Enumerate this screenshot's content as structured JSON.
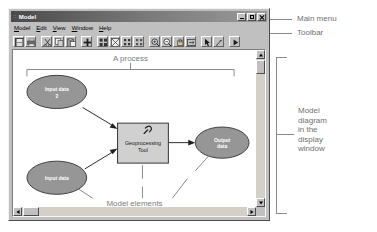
{
  "window": {
    "title": "Model",
    "title_prefix_dots": "::",
    "controls": [
      {
        "name": "minimize",
        "label": "Minimize"
      },
      {
        "name": "maximize",
        "label": "Maximize"
      },
      {
        "name": "close",
        "label": "Close"
      }
    ]
  },
  "menu": {
    "items": [
      {
        "label": "Model",
        "mnemonic": "M"
      },
      {
        "label": "Edit",
        "mnemonic": "E"
      },
      {
        "label": "View",
        "mnemonic": "V"
      },
      {
        "label": "Window",
        "mnemonic": "W"
      },
      {
        "label": "Help",
        "mnemonic": "H"
      }
    ]
  },
  "toolbar": {
    "buttons": [
      {
        "icon": "save-icon",
        "label": "Save"
      },
      {
        "icon": "print-icon",
        "label": "Print"
      },
      {
        "icon": "cut-icon",
        "label": "Cut"
      },
      {
        "icon": "copy-icon",
        "label": "Copy"
      },
      {
        "icon": "paste-icon",
        "label": "Paste"
      },
      {
        "icon": "add-data-icon",
        "label": "Add Data"
      },
      {
        "icon": "auto-layout-icon",
        "label": "Auto Layout"
      },
      {
        "icon": "diagram-properties-icon",
        "label": "Diagram Properties"
      },
      {
        "icon": "select-all-icon",
        "label": "Select All"
      },
      {
        "icon": "full-extent-icon",
        "label": "Full Extent"
      },
      {
        "icon": "zoom-in-icon",
        "label": "Zoom In"
      },
      {
        "icon": "zoom-out-icon",
        "label": "Zoom Out"
      },
      {
        "icon": "pan-icon",
        "label": "Pan"
      },
      {
        "icon": "fit-window-icon",
        "label": "Fit To Window"
      },
      {
        "icon": "select-pointer-icon",
        "label": "Select Elements"
      },
      {
        "icon": "connect-icon",
        "label": "Connect"
      },
      {
        "icon": "run-icon",
        "label": "Run"
      }
    ]
  },
  "diagram": {
    "process_label": "A process",
    "elements_label": "Model elements",
    "nodes": [
      {
        "name": "input-data-2",
        "type": "ellipse",
        "label_lines": [
          "Input data",
          "2"
        ]
      },
      {
        "name": "input-data",
        "type": "ellipse",
        "label_lines": [
          "Input data"
        ]
      },
      {
        "name": "geoprocessing-tool",
        "type": "rectangle",
        "label_lines": [
          "Geoprocessing",
          "Tool"
        ]
      },
      {
        "name": "output-data",
        "type": "ellipse",
        "label_lines": [
          "Output",
          "data"
        ]
      }
    ],
    "colors": {
      "ellipse_fill": "#969696",
      "ellipse_stroke": "#404040",
      "tool_fill": "#d0d0d0",
      "tool_stroke": "#333333",
      "annotation": "#7a7a7a"
    }
  },
  "callouts": [
    {
      "name": "main-menu",
      "text": "Main menu"
    },
    {
      "name": "toolbar",
      "text": "Toolbar"
    },
    {
      "name": "model-diagram",
      "text": "Model\ndiagram\nin the\ndisplay\nwindow"
    }
  ],
  "scrollbars": {
    "vertical": {
      "name": "vertical-scrollbar"
    },
    "horizontal": {
      "name": "horizontal-scrollbar"
    }
  }
}
